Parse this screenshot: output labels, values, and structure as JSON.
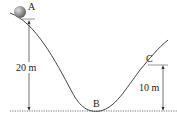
{
  "diagram": {
    "points": {
      "A": "A",
      "B": "B",
      "C": "C"
    },
    "heights": {
      "A": "20 m",
      "C": "10 m"
    },
    "colors": {
      "track": "#444444",
      "ball": "#888888",
      "ground": "#555555"
    }
  }
}
